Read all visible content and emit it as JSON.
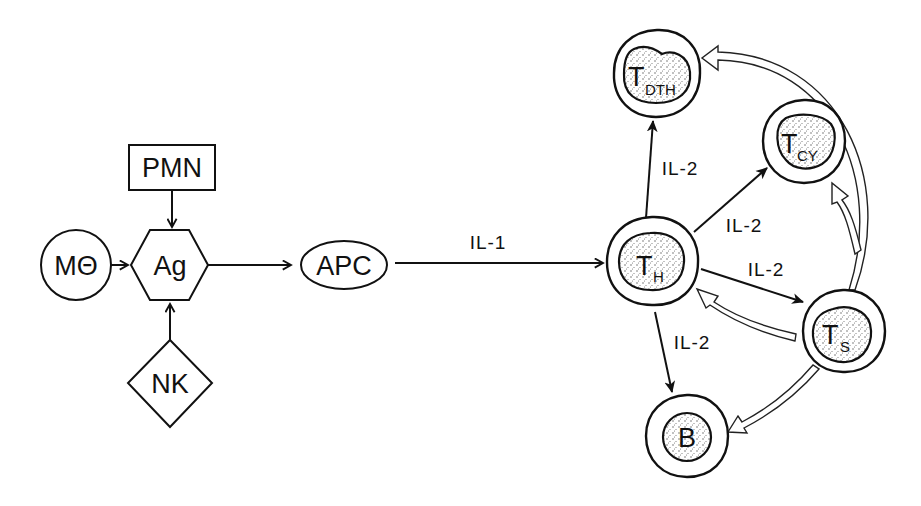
{
  "diagram": {
    "nodes": {
      "mtheta": {
        "label": "MΘ",
        "shape": "circle"
      },
      "pmn": {
        "label": "PMN",
        "shape": "rectangle"
      },
      "ag": {
        "label": "Ag",
        "shape": "hexagon"
      },
      "nk": {
        "label": "NK",
        "shape": "diamond"
      },
      "apc": {
        "label": "APC",
        "shape": "ellipse"
      },
      "th": {
        "main": "T",
        "sub": "H",
        "shape": "cell"
      },
      "tdth": {
        "main": "T",
        "sub": "DTH",
        "shape": "cell"
      },
      "tcy": {
        "main": "T",
        "sub": "CY",
        "shape": "cell"
      },
      "ts": {
        "main": "T",
        "sub": "S",
        "shape": "cell"
      },
      "b": {
        "label": "B",
        "shape": "cell"
      }
    },
    "edges": {
      "mtheta_ag": {
        "from": "MΘ",
        "to": "Ag",
        "style": "solid-arrow"
      },
      "pmn_ag": {
        "from": "PMN",
        "to": "Ag",
        "style": "solid-arrow"
      },
      "nk_ag": {
        "from": "NK",
        "to": "Ag",
        "style": "solid-arrow"
      },
      "ag_apc": {
        "from": "Ag",
        "to": "APC",
        "style": "solid-arrow"
      },
      "apc_th": {
        "from": "APC",
        "to": "TH",
        "label": "IL-1",
        "style": "solid-arrow"
      },
      "th_tdth": {
        "from": "TH",
        "to": "TDTH",
        "label": "IL-2",
        "style": "solid-arrow"
      },
      "th_tcy": {
        "from": "TH",
        "to": "TCY",
        "label": "IL-2",
        "style": "solid-arrow"
      },
      "th_ts": {
        "from": "TH",
        "to": "TS",
        "label": "IL-2",
        "style": "solid-arrow"
      },
      "th_b": {
        "from": "TH",
        "to": "B",
        "label": "IL-2",
        "style": "solid-arrow"
      },
      "ts_th": {
        "from": "TS",
        "to": "TH",
        "style": "hollow-arrow"
      },
      "ts_tcy": {
        "from": "TS",
        "to": "TCY",
        "style": "hollow-arrow"
      },
      "ts_tdth": {
        "from": "TS",
        "to": "TDTH",
        "style": "hollow-arrow"
      },
      "ts_b": {
        "from": "TS",
        "to": "B",
        "style": "hollow-arrow"
      }
    }
  }
}
